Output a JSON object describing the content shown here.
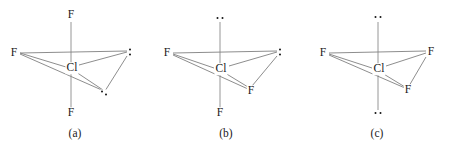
{
  "figure": {
    "background_color": "#ffffff",
    "bond_color": "#808080",
    "text_color": "#1a1a1a",
    "dot_color": "#141414"
  },
  "structures": [
    {
      "id": "a",
      "caption": "(a)",
      "center_atom": "Cl",
      "substituents": {
        "top": {
          "kind": "atom",
          "label": "F"
        },
        "left": {
          "kind": "atom",
          "label": "F"
        },
        "right": {
          "kind": "lone-pair",
          "label": ":",
          "orientation": "vertical"
        },
        "lower_right": {
          "kind": "lone-pair",
          "label": "··",
          "orientation": "diagonal"
        },
        "bottom": {
          "kind": "atom",
          "label": "F"
        }
      }
    },
    {
      "id": "b",
      "caption": "(b)",
      "center_atom": "Cl",
      "substituents": {
        "top": {
          "kind": "lone-pair",
          "label": "··",
          "orientation": "horizontal"
        },
        "left": {
          "kind": "atom",
          "label": "F"
        },
        "right": {
          "kind": "lone-pair",
          "label": ":",
          "orientation": "vertical"
        },
        "lower_right": {
          "kind": "atom",
          "label": "F"
        },
        "bottom": {
          "kind": "atom",
          "label": "F"
        }
      }
    },
    {
      "id": "c",
      "caption": "(c)",
      "center_atom": "Cl",
      "substituents": {
        "top": {
          "kind": "lone-pair",
          "label": "··",
          "orientation": "horizontal"
        },
        "left": {
          "kind": "atom",
          "label": "F"
        },
        "right": {
          "kind": "atom",
          "label": "F"
        },
        "lower_right": {
          "kind": "atom",
          "label": "F"
        },
        "bottom": {
          "kind": "lone-pair",
          "label": "··",
          "orientation": "horizontal"
        }
      }
    }
  ]
}
